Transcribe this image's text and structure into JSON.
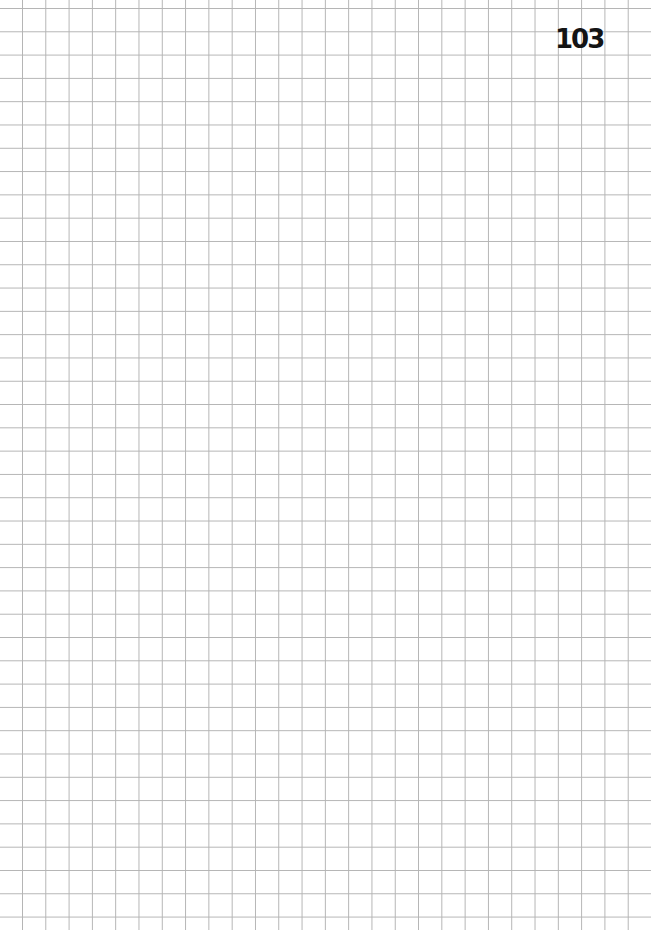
{
  "page": {
    "type": "grid-paper",
    "page_number": "103",
    "grid_color": "#b4b4b4",
    "background_color": "#ffffff",
    "text_color": "#141414"
  }
}
